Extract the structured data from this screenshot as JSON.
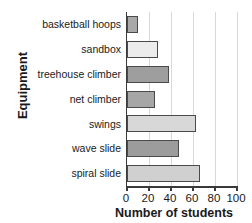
{
  "chart_data": {
    "type": "bar",
    "orientation": "horizontal",
    "title": "",
    "xlabel": "Number of students",
    "ylabel": "Equipment",
    "categories": [
      "basketball hoops",
      "sandbox",
      "treehouse climber",
      "net climber",
      "swings",
      "wave slide",
      "spiral slide"
    ],
    "values": [
      10,
      28,
      38,
      25,
      63,
      47,
      66
    ],
    "xlim": [
      0,
      100
    ],
    "xticks": [
      0,
      20,
      40,
      60,
      80,
      100
    ],
    "xtick_labels": [
      "0",
      "20",
      "40",
      "60",
      "80",
      "100"
    ],
    "grid": true,
    "grid_axis": "x",
    "legend": false,
    "bar_colors": [
      "#a9a9a9",
      "#ececec",
      "#9e9e9e",
      "#a6a6a6",
      "#d8d8d8",
      "#9c9c9c",
      "#d0d0d0"
    ],
    "bar_edge_color": "#4a4a4a",
    "grid_color": "#d8d8d8",
    "axis_color": "#3a3a3a"
  },
  "axes": {
    "y_title": "Equipment",
    "x_title": "Number of students"
  },
  "clipped_top_title": ""
}
